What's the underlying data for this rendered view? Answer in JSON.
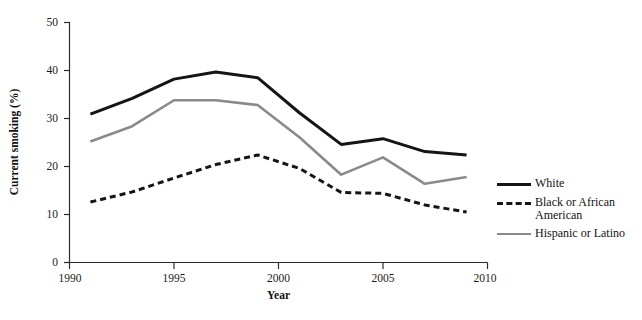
{
  "chart_data": {
    "type": "line",
    "title": "",
    "xlabel": "Year",
    "ylabel": "Current smoking (%)",
    "xlim": [
      1990,
      2010
    ],
    "ylim": [
      0,
      50
    ],
    "xticks": [
      1990,
      1995,
      2000,
      2005,
      2010
    ],
    "yticks": [
      0,
      10,
      20,
      30,
      40,
      50
    ],
    "grid": false,
    "legend_position": "right",
    "x": [
      1991,
      1993,
      1995,
      1997,
      1999,
      2001,
      2003,
      2005,
      2007,
      2009
    ],
    "series": [
      {
        "name": "White",
        "color": "#151515",
        "style": "solid",
        "width": 3.0,
        "values": [
          30.9,
          34.2,
          38.2,
          39.7,
          38.5,
          31.2,
          24.6,
          25.8,
          23.1,
          22.4
        ]
      },
      {
        "name": "Black or African\nAmerican",
        "color": "#151515",
        "style": "dashed",
        "width": 3.0,
        "values": [
          12.6,
          14.7,
          17.6,
          20.4,
          22.4,
          19.6,
          14.6,
          14.4,
          12.0,
          10.5
        ]
      },
      {
        "name": "Hispanic or Latino",
        "color": "#8a8a8a",
        "style": "solid",
        "width": 2.6,
        "values": [
          25.2,
          28.4,
          33.8,
          33.8,
          32.8,
          26.1,
          18.3,
          21.9,
          16.4,
          17.8
        ]
      }
    ]
  },
  "legend": {
    "entries": [
      {
        "label": "White",
        "swatch": "solid-black-line-icon"
      },
      {
        "label": "Black or African\nAmerican",
        "swatch": "dashed-black-line-icon"
      },
      {
        "label": "Hispanic or Latino",
        "swatch": "solid-gray-line-icon"
      }
    ]
  },
  "axes": {
    "x_title": "Year",
    "y_title": "Current smoking (%)",
    "x_tick_labels": [
      "1990",
      "1995",
      "2000",
      "2005",
      "2010"
    ],
    "y_tick_labels": [
      "0",
      "10",
      "20",
      "30",
      "40",
      "50"
    ]
  }
}
